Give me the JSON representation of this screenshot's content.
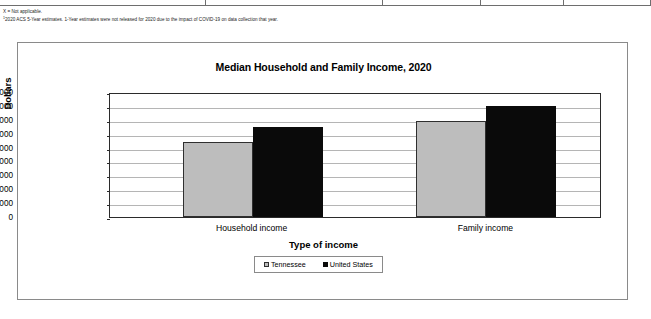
{
  "footnotes": [
    "X = Not applicable.",
    "2020 ACS 5-Year estimates. 1-Year estimates were not released for 2020 due to the impact of COVID-19 on data collection that year."
  ],
  "footnote_marker": "1",
  "legend": {
    "items": [
      {
        "label": "Tennessee",
        "color": "#bdbdbd"
      },
      {
        "label": "United States",
        "color": "#0a0a0a"
      }
    ]
  },
  "chart_data": {
    "type": "bar",
    "title": "Median Household and Family Income, 2020",
    "xlabel": "Type of income",
    "ylabel": "Dollars",
    "categories": [
      "Household income",
      "Family income"
    ],
    "series": [
      {
        "name": "Tennessee",
        "color": "#bdbdbd",
        "values": [
          54000,
          69000
        ]
      },
      {
        "name": "United States",
        "color": "#0a0a0a",
        "values": [
          65000,
          80000
        ]
      }
    ],
    "ylim": [
      0,
      90000
    ],
    "ytick_labels": [
      "90,000",
      "80,000",
      "70,000",
      "60,000",
      "50,000",
      "40,000",
      "30,000",
      "20,000",
      "10,000",
      "0"
    ],
    "ytick_values": [
      90000,
      80000,
      70000,
      60000,
      50000,
      40000,
      30000,
      20000,
      10000,
      0
    ],
    "grid": true,
    "legend_position": "bottom"
  }
}
